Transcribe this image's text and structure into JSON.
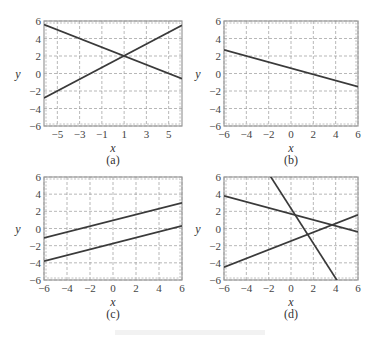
{
  "chart_data": [
    {
      "type": "line",
      "panel_label": "(a)",
      "xlabel": "x",
      "ylabel": "y",
      "xlim": [
        -6.2,
        6.2
      ],
      "ylim": [
        -6,
        6
      ],
      "xticks": [
        -5,
        -3,
        -1,
        1,
        3,
        5
      ],
      "yticks": [
        -6,
        -4,
        -2,
        0,
        2,
        4,
        6
      ],
      "xtick_labels": [
        "−5",
        "−3",
        "−1",
        "1",
        "3",
        "5"
      ],
      "ytick_labels": [
        "−6",
        "−4",
        "−2",
        "0",
        "2",
        "4",
        "6"
      ],
      "grid": true,
      "series": [
        {
          "name": "line-1",
          "x": [
            -6.2,
            6.2
          ],
          "y": [
            5.6,
            -0.6
          ]
        },
        {
          "name": "line-2",
          "x": [
            -6.2,
            6.2
          ],
          "y": [
            -2.8,
            5.5
          ]
        }
      ]
    },
    {
      "type": "line",
      "panel_label": "(b)",
      "xlabel": "x",
      "ylabel": "y",
      "xlim": [
        -6,
        6
      ],
      "ylim": [
        -6,
        6
      ],
      "xticks": [
        -6,
        -4,
        -2,
        0,
        2,
        4,
        6
      ],
      "yticks": [
        -6,
        -4,
        -2,
        0,
        2,
        4,
        6
      ],
      "xtick_labels": [
        "−6",
        "−4",
        "−2",
        "0",
        "2",
        "4",
        "6"
      ],
      "ytick_labels": [
        "−6",
        "−4",
        "−2",
        "0",
        "2",
        "4",
        "6"
      ],
      "grid": true,
      "series": [
        {
          "name": "line-1",
          "x": [
            -6,
            6
          ],
          "y": [
            2.7,
            -1.5
          ]
        }
      ]
    },
    {
      "type": "line",
      "panel_label": "(c)",
      "xlabel": "x",
      "ylabel": "y",
      "xlim": [
        -6,
        6
      ],
      "ylim": [
        -6,
        6
      ],
      "xticks": [
        -6,
        -4,
        -2,
        0,
        2,
        4,
        6
      ],
      "yticks": [
        -6,
        -4,
        -2,
        0,
        2,
        4,
        6
      ],
      "xtick_labels": [
        "−6",
        "−4",
        "−2",
        "0",
        "2",
        "4",
        "6"
      ],
      "ytick_labels": [
        "−6",
        "−4",
        "−2",
        "0",
        "2",
        "4",
        "6"
      ],
      "grid": true,
      "series": [
        {
          "name": "line-1",
          "x": [
            -6,
            6
          ],
          "y": [
            -1.1,
            3.0
          ]
        },
        {
          "name": "line-2",
          "x": [
            -6,
            6
          ],
          "y": [
            -3.8,
            0.3
          ]
        }
      ]
    },
    {
      "type": "line",
      "panel_label": "(d)",
      "xlabel": "x",
      "ylabel": "y",
      "xlim": [
        -6,
        6
      ],
      "ylim": [
        -6,
        6
      ],
      "xticks": [
        -6,
        -4,
        -2,
        0,
        2,
        4,
        6
      ],
      "yticks": [
        -6,
        -4,
        -2,
        0,
        2,
        4,
        6
      ],
      "xtick_labels": [
        "−6",
        "−4",
        "−2",
        "0",
        "2",
        "4",
        "6"
      ],
      "ytick_labels": [
        "−6",
        "−4",
        "−2",
        "0",
        "2",
        "4",
        "6"
      ],
      "grid": true,
      "series": [
        {
          "name": "line-1",
          "x": [
            -6,
            6
          ],
          "y": [
            3.8,
            -0.4
          ]
        },
        {
          "name": "line-2",
          "x": [
            -6,
            6
          ],
          "y": [
            -4.5,
            1.6
          ]
        },
        {
          "name": "line-3",
          "x": [
            -1.9,
            4.2
          ],
          "y": [
            6.2,
            -6.2
          ]
        }
      ]
    }
  ]
}
